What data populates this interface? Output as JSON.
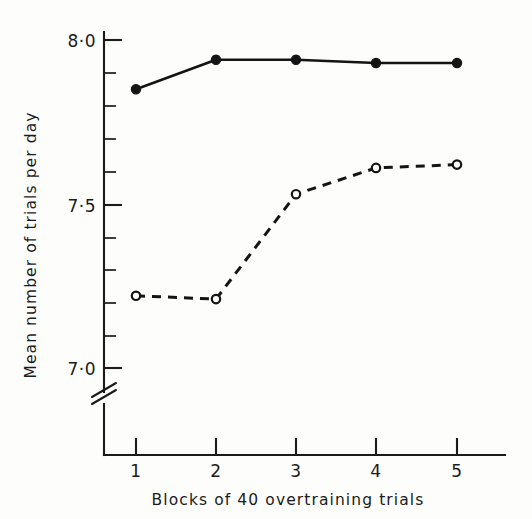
{
  "chart_data": {
    "type": "line",
    "title": "",
    "xlabel": "Blocks of 40 overtraining trials",
    "ylabel": "Mean number of trials per day",
    "x": [
      1,
      2,
      3,
      4,
      5
    ],
    "xtick_labels": [
      "1",
      "2",
      "3",
      "4",
      "5"
    ],
    "xlim": [
      0.55,
      5.45
    ],
    "ylim": [
      6.95,
      8.03
    ],
    "ytick_labels": [
      "8·0",
      "7·5",
      "7·0"
    ],
    "ytick_values": [
      8.0,
      7.5,
      7.0
    ],
    "yminor_step": 0.1,
    "grid": false,
    "legend": "none",
    "axis_break": true,
    "axis_break_note": "y-axis broken below 7.0",
    "series": [
      {
        "name": "solid-filled-circles",
        "marker": "filled-circle",
        "line_style": "solid",
        "color": "#141414",
        "values": [
          7.85,
          7.94,
          7.94,
          7.93,
          7.93
        ]
      },
      {
        "name": "dashed-open-circles",
        "marker": "open-circle",
        "line_style": "dashed",
        "color": "#141414",
        "values": [
          7.22,
          7.21,
          7.53,
          7.61,
          7.62
        ]
      }
    ]
  },
  "axes": {
    "y_title": "Mean number of trials per day",
    "x_title": "Blocks of 40 overtraining trials"
  }
}
